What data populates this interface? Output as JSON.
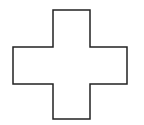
{
  "figure": {
    "shape": "cross",
    "stroke_color": "#222222",
    "fill_color": "#ffffff",
    "points": "53,10 90,10 90,47 127,47 127,84 90,84 90,119 53,119 53,84 13,84 13,47 53,47"
  }
}
